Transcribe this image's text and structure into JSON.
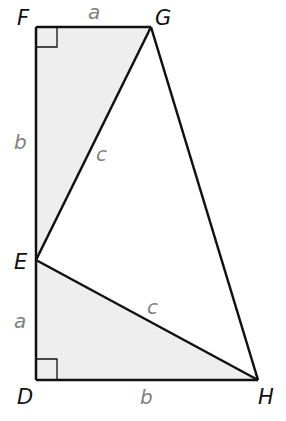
{
  "diagram": {
    "type": "geometry-trapezoid-pythagorean-proof",
    "colors": {
      "shade": "#eeeeee",
      "stroke": "#111111",
      "side_label": "#808080",
      "vertex_label": "#111111"
    },
    "vertices": {
      "F": {
        "label": "F",
        "x": 36,
        "y": 27
      },
      "G": {
        "label": "G",
        "x": 151,
        "y": 27
      },
      "E": {
        "label": "E",
        "x": 36,
        "y": 260
      },
      "D": {
        "label": "D",
        "x": 36,
        "y": 380
      },
      "H": {
        "label": "H",
        "x": 258,
        "y": 380
      }
    },
    "side_labels": {
      "FG": "a",
      "FE": "b",
      "EG": "c",
      "ED": "a",
      "DH": "b",
      "EH": "c"
    },
    "right_angles": [
      "F",
      "D"
    ]
  }
}
